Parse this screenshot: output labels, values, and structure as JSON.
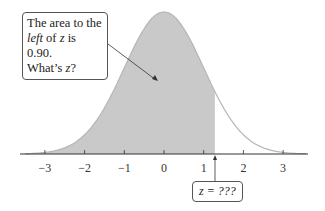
{
  "chart_data": {
    "type": "area",
    "title": "",
    "xlabel": "",
    "ylabel": "",
    "distribution": "standard normal",
    "xlim": [
      -3.5,
      3.6
    ],
    "ticks": [
      -3,
      -2,
      -1,
      0,
      1,
      2,
      3
    ],
    "tick_labels": [
      "−3",
      "−2",
      "−1",
      "0",
      "1",
      "2",
      "3"
    ],
    "shaded_region": {
      "from": "-inf",
      "to": 1.28,
      "area": 0.9
    },
    "fill_color": "#c8c8c8",
    "curve_color": "#b0b0b0",
    "annotations": [
      {
        "text_parts": [
          "The area to the ",
          "left",
          " of ",
          "z",
          " is 0.90. What’s ",
          "z",
          "?"
        ]
      },
      {
        "text": "z = ???"
      }
    ]
  },
  "callout_main": {
    "line1": "The area to the",
    "left": "left",
    "of": " of ",
    "z1": "z",
    "is": " is 0.90.",
    "whats": "What’s ",
    "z2": "z",
    "q": "?"
  },
  "callout_z": {
    "text": "z = ???"
  },
  "ticks": [
    "−3",
    "−2",
    "−1",
    "0",
    "1",
    "2",
    "3"
  ]
}
